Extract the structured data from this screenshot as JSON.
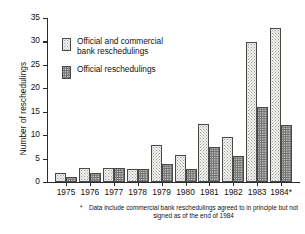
{
  "chart_data": {
    "type": "bar",
    "title": "",
    "xlabel": "",
    "ylabel": "Number of reschedulings",
    "ylim": [
      0,
      35
    ],
    "yticks": [
      0,
      5,
      10,
      15,
      20,
      25,
      30,
      35
    ],
    "grid": false,
    "legend_position": "upper-left-inside",
    "categories": [
      "1975",
      "1976",
      "1977",
      "1978",
      "1979",
      "1980",
      "1981",
      "1982",
      "1983",
      "1984*"
    ],
    "series": [
      {
        "name": "Official and commercial bank reschedulings",
        "values": [
          2,
          3,
          3,
          2.7,
          7.8,
          5.8,
          12.4,
          9.6,
          29.8,
          32.8
        ]
      },
      {
        "name": "Official reschedulings",
        "values": [
          1,
          1.9,
          2.9,
          2.7,
          3.8,
          2.7,
          7.5,
          5.6,
          16.1,
          12.2
        ]
      }
    ],
    "annotations": [
      "* Data include commercial bank reschedulings agreed to in principle but not signed as of the end of 1984"
    ]
  },
  "axis": {
    "y_title": "Number of reschedulings",
    "y_tick_labels": [
      "0",
      "5",
      "10",
      "15",
      "20",
      "25",
      "30",
      "35"
    ],
    "x_tick_labels": [
      "1975",
      "1976",
      "1977",
      "1978",
      "1979",
      "1980",
      "1981",
      "1982",
      "1983",
      "1984*"
    ]
  },
  "legend": {
    "items": [
      {
        "label": "Official and commercial\nbank reschedulings",
        "swatch": "light-stipple-swatch",
        "color": "#f4f4f0"
      },
      {
        "label": "Official reschedulings",
        "swatch": "dark-stipple-swatch",
        "color": "#a9a9a9"
      }
    ]
  },
  "footnote": {
    "marker": "*",
    "text": "Data include commercial bank reschedulings agreed to in principle but not signed as of the end of 1984"
  },
  "colors": {
    "axis": "#2b2b2b",
    "bar_light_fill": "#f2f2ee",
    "bar_dark_fill": "#a9a9a9",
    "bar_stroke": "#4a4a4a",
    "text": "#111111",
    "background": "#ffffff"
  }
}
